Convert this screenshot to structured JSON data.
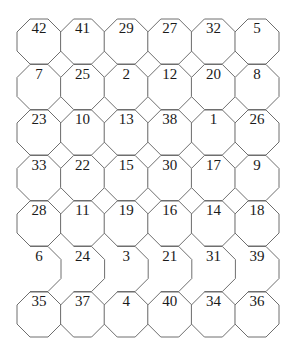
{
  "diagram": {
    "type": "octagon-number-grid",
    "columns": 6,
    "rows": 7,
    "stroke_color": "#6e6e6e",
    "text_color": "#1a1a1a",
    "cells": [
      [
        42,
        41,
        29,
        27,
        32,
        5
      ],
      [
        7,
        25,
        2,
        12,
        20,
        8
      ],
      [
        23,
        10,
        13,
        38,
        1,
        26
      ],
      [
        33,
        22,
        15,
        30,
        17,
        9
      ],
      [
        28,
        11,
        19,
        16,
        14,
        18
      ],
      [
        6,
        24,
        3,
        21,
        31,
        39
      ],
      [
        35,
        37,
        4,
        40,
        34,
        36
      ]
    ],
    "open_left_row_index": 5
  }
}
